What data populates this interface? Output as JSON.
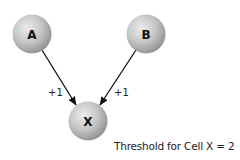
{
  "diagram": {
    "nodes": [
      {
        "id": "A",
        "label": "A",
        "cx": 32,
        "cy": 34,
        "r": 19
      },
      {
        "id": "B",
        "label": "B",
        "cx": 146,
        "cy": 34,
        "r": 19
      },
      {
        "id": "X",
        "label": "X",
        "cx": 88,
        "cy": 121,
        "r": 19
      }
    ],
    "edges": [
      {
        "from": "A",
        "to": "X",
        "label": "+1"
      },
      {
        "from": "B",
        "to": "X",
        "label": "+1"
      }
    ],
    "caption": "Threshold for Cell X = 2",
    "colors": {
      "node_highlight": "#ececec",
      "node_mid": "#c4c4c4",
      "node_shadow": "#8e8e8e",
      "edge": "#111111"
    }
  }
}
